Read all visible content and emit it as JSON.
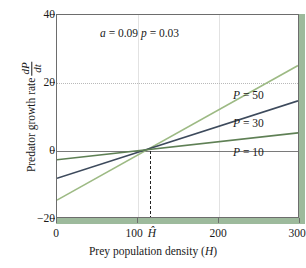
{
  "chart_data": {
    "type": "line",
    "title": "",
    "xlabel": "Prey population density (H)",
    "ylabel": "Predator growth rate dP/dt",
    "ylabel_text": "Predator growth rate",
    "ylabel_frac_num": "dP",
    "ylabel_frac_den": "dt",
    "xlim": [
      0,
      300
    ],
    "ylim": [
      -20,
      40
    ],
    "xticks": [
      0,
      100,
      200,
      300
    ],
    "xtick_labels": [
      "0",
      "100",
      "200",
      "300"
    ],
    "yticks": [
      -20,
      0,
      20,
      40
    ],
    "ytick_labels": [
      "−20",
      "0",
      "20",
      "40"
    ],
    "grid": "horizontal dotted at y=20; vertical faint at x=100,200; solid zero line at y=0",
    "legend_position": "inline-right",
    "annotation": "a = 0.09  p = 0.03",
    "annotation_a": "a = 0.09",
    "annotation_p": "p = 0.03",
    "equilibrium_marker": "Ĥ",
    "equilibrium_x": 115,
    "series": [
      {
        "name": "P = 50",
        "label": "P = 50",
        "color": "#9dba84",
        "x": [
          0,
          300
        ],
        "values": [
          -15,
          25
        ]
      },
      {
        "name": "P = 30",
        "label": "P = 30",
        "color": "#3d4a5c",
        "x": [
          0,
          300
        ],
        "values": [
          -8.5,
          14.5
        ]
      },
      {
        "name": "P = 10",
        "label": "P = 10",
        "color": "#5f8055",
        "x": [
          0,
          300
        ],
        "values": [
          -3,
          5
        ]
      }
    ]
  },
  "axes": {
    "x_title": "Prey population density (",
    "x_title_var": "H",
    "x_title_close": ")",
    "y_title_text": "Predator growth rate",
    "x_tick_0": "0",
    "x_tick_100": "100",
    "x_tick_hhat": "Ĥ",
    "x_tick_200": "200",
    "x_tick_300": "300",
    "y_tick_40": "40",
    "y_tick_20": "20",
    "y_tick_0": "0",
    "y_tick_neg20": "−20"
  },
  "annotation": {
    "a_label": "a",
    "a_eq": "= 0.09",
    "p_label": "p",
    "p_eq": "= 0.03"
  },
  "labels": {
    "p50_var": "P",
    "p50_val": "= 50",
    "p30_var": "P",
    "p30_val": "= 30",
    "p10_var": "P",
    "p10_val": "= 10"
  },
  "colors": {
    "series_p50": "#9dba84",
    "series_p30": "#3d4a5c",
    "series_p10": "#5f8055",
    "panel_edge": "#9dba9c",
    "frame": "#6d6d6d",
    "zero_line": "#7a7a7a",
    "grid_dotted": "#b9b9b9",
    "grid_vertical": "#e2e2e2",
    "background": "#ffffff"
  }
}
